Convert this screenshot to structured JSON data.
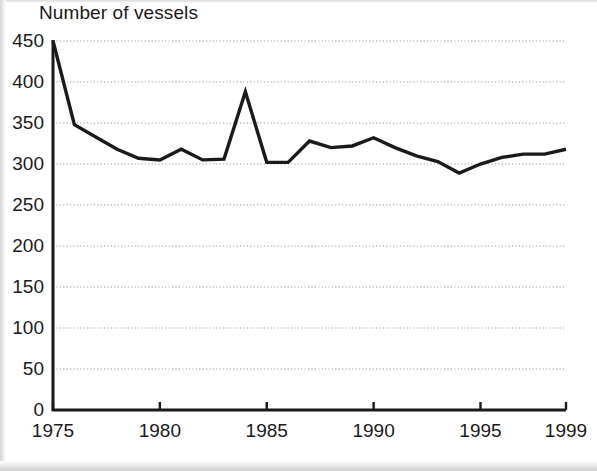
{
  "chart_data": {
    "type": "line",
    "title": "Number of vessels",
    "xlabel": "",
    "ylabel": "",
    "ylim": [
      0,
      450
    ],
    "xlim": [
      1975,
      1999
    ],
    "ytick_labels": [
      "0",
      "50",
      "100",
      "150",
      "200",
      "250",
      "300",
      "350",
      "400",
      "450"
    ],
    "yticks": [
      0,
      50,
      100,
      150,
      200,
      250,
      300,
      350,
      400,
      450
    ],
    "xtick_labels": [
      "1975",
      "1980",
      "1985",
      "1990",
      "1995",
      "1999"
    ],
    "xticks": [
      1975,
      1980,
      1985,
      1990,
      1995,
      1999
    ],
    "grid": "horizontal-dotted",
    "legend": "none",
    "line_color": "#1a1a1a",
    "x": [
      1975,
      1976,
      1977,
      1978,
      1979,
      1980,
      1981,
      1982,
      1983,
      1984,
      1985,
      1986,
      1987,
      1988,
      1989,
      1990,
      1991,
      1992,
      1993,
      1994,
      1995,
      1996,
      1997,
      1998,
      1999
    ],
    "values": [
      450,
      348,
      333,
      318,
      307,
      305,
      318,
      305,
      306,
      388,
      302,
      302,
      328,
      320,
      322,
      332,
      320,
      310,
      303,
      289,
      300,
      308,
      312,
      312,
      318
    ],
    "series": [
      {
        "name": "Number of vessels",
        "values": [
          450,
          348,
          333,
          318,
          307,
          305,
          318,
          305,
          306,
          388,
          302,
          302,
          328,
          320,
          322,
          332,
          320,
          310,
          303,
          289,
          300,
          308,
          312,
          312,
          318
        ]
      }
    ],
    "annotations": [
      {
        "label": "peak",
        "x": 1984,
        "y": 388
      },
      {
        "label": "minimum",
        "x": 1994,
        "y": 289
      }
    ]
  },
  "figure": {
    "background_color": "#ffffff",
    "axis_color": "#1a1a1a",
    "grid_color": "#9a9a9a"
  }
}
